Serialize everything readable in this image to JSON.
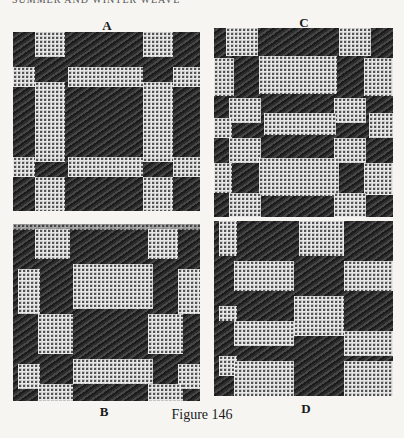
{
  "page": {
    "running_head": "SUMMER AND WINTER WEAVE",
    "caption": "Figure 146"
  },
  "panels": [
    {
      "id": "A",
      "label": "A",
      "description": "woven sample with large dark central block framed by light lattice bands"
    },
    {
      "id": "C",
      "label": "C",
      "description": "woven sample with diagonal arrangement of light lattice blocks on dark twill"
    },
    {
      "id": "B",
      "label": "B",
      "description": "woven sample with light lattice blocks in offset arrangement on dark twill"
    },
    {
      "id": "D",
      "label": "D",
      "description": "woven sample with alternating dark and light dotted blocks in checker pattern"
    }
  ],
  "colors": {
    "paper": "#f6f5f2",
    "dark_thread": "#3c3c3c",
    "light_thread": "#f2f2f2"
  }
}
